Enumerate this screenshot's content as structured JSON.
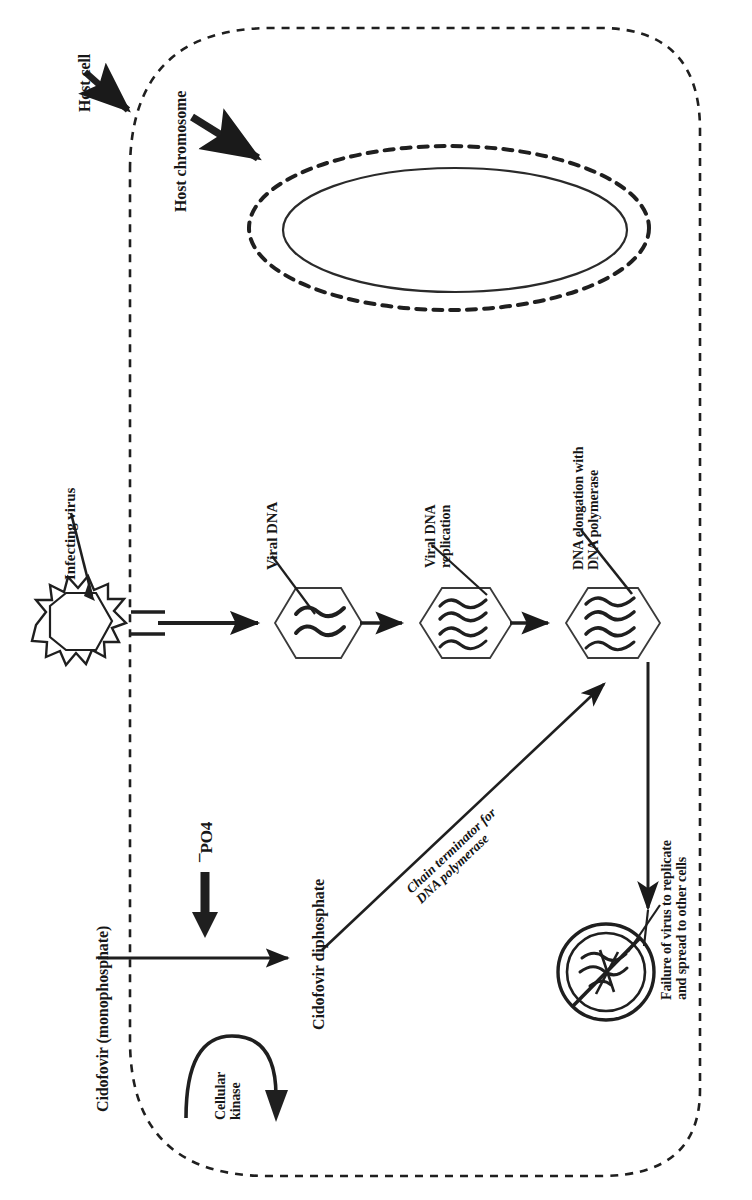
{
  "figure": {
    "orientation": "rotated-90-ccw",
    "ink_color": "#1a1a1a",
    "background_color": "#ffffff"
  },
  "labels": {
    "host_cell": "Host cell",
    "host_chromosome": "Host chromosome",
    "infecting_virus": "Infecting virus",
    "viral_dna": "Viral DNA",
    "viral_dna_replication_line1": "Viral DNA",
    "viral_dna_replication_line2": "replication",
    "dna_elongation_line1": "DNA elongation with",
    "dna_elongation_line2": "DNA polymerase",
    "phosphate": "¯PO4",
    "cidofovir_monophosphate": "Cidofovir (monophosphate)",
    "cidofovir_diphosphate": "Cidofovir diphosphate",
    "cellular_kinase_line1": "Cellular",
    "cellular_kinase_line2": "kinase",
    "chain_terminator_line1": "Chain terminator for",
    "chain_terminator_line2": "DNA polymerase",
    "failure_line1": "Failure of virus to replicate",
    "failure_line2": "and spread to other cells"
  },
  "shapes": {
    "cell_membrane": "dashed-rounded-rectangle",
    "nucleus_outer": "dashed-ellipse",
    "nucleus_inner": "solid-ellipse",
    "virion": "spiked-hexagon",
    "capsid": "hexagon",
    "blocked_virus": "no-entry-circle-with-tangled-dna"
  },
  "capsids": [
    {
      "name": "viral-dna-capsid",
      "strands": 2
    },
    {
      "name": "viral-dna-replication-capsid",
      "strands": 4
    },
    {
      "name": "dna-elongation-capsid",
      "strands": 4
    }
  ]
}
